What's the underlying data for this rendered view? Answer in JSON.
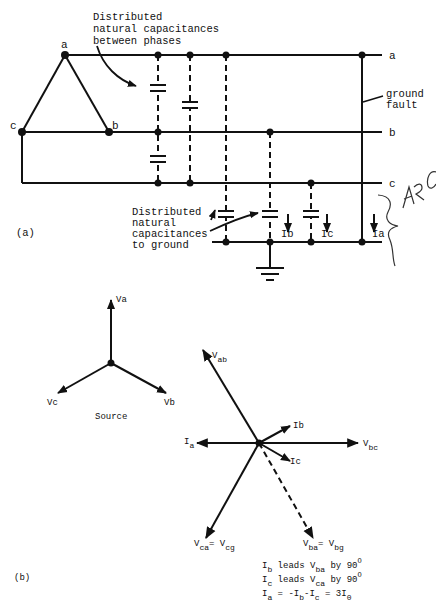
{
  "figure_a": {
    "panel_label": "(a)",
    "phase_labels_delta": {
      "a": "a",
      "b": "b",
      "c": "c"
    },
    "line_labels": {
      "a": "a",
      "b": "b",
      "c": "c"
    },
    "annotation_between_phases": [
      "Distributed",
      "natural capacitances",
      "between phases"
    ],
    "annotation_to_ground": [
      "Distributed",
      "natural",
      "capacitances",
      "to ground"
    ],
    "ground_fault_label": [
      "ground",
      "fault"
    ],
    "currents": {
      "ib": "Ib",
      "ic": "Ic",
      "ia": "Ia"
    },
    "handwritten_note": "ARC",
    "colors": {
      "ink": "#111111",
      "background": "#ffffff"
    }
  },
  "figure_b": {
    "panel_label": "(b)",
    "source": {
      "title": "Source",
      "va": "Va",
      "vb": "Vb",
      "vc": "Vc"
    },
    "phasors": {
      "vab": {
        "main": "V",
        "sub": "ab"
      },
      "vbc": {
        "main": "V",
        "sub": "bc"
      },
      "ia": {
        "main": "I",
        "sub": "a"
      },
      "ib": "Ib",
      "ic": "Ic",
      "vca": {
        "main": "V",
        "sub": "ca",
        "eq": "=",
        "main2": "V",
        "sub2": "cg"
      },
      "vba": {
        "main": "V",
        "sub": "ba",
        "eq": "=",
        "main2": "V",
        "sub2": "bg"
      }
    },
    "notes": [
      {
        "a": "I",
        "a_sub": "b",
        "mid": " leads ",
        "b": "V",
        "b_sub": "ba",
        "end": " by 90",
        "sup": "O"
      },
      {
        "a": "I",
        "a_sub": "c",
        "mid": " leads ",
        "b": "V",
        "b_sub": "ca",
        "end": " by 90",
        "sup": "O"
      },
      {
        "a": "I",
        "a_sub": "a",
        "mid": " = -",
        "b": "I",
        "b_sub": "b",
        "end": "-I",
        "end_sub": "c",
        "tail": " = 3I",
        "tail_sub": "0"
      }
    ]
  }
}
